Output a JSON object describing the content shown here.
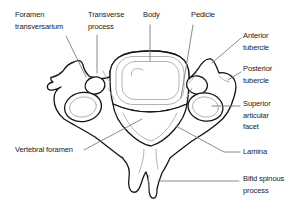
{
  "figure": {
    "illustration": "cervical-vertebra-superior-view",
    "colors": {
      "background": "#ffffff",
      "outline": "#141414",
      "detail": "#9a9a9a",
      "leader": "#7d7d7d",
      "text": "#1a1a1a"
    }
  },
  "labels": [
    {
      "id": "foramen-transversarium",
      "lines": [
        "Foramen",
        "transversarium"
      ]
    },
    {
      "id": "transverse-process",
      "lines": [
        "Transverse",
        "process"
      ]
    },
    {
      "id": "body",
      "lines": [
        "Body"
      ]
    },
    {
      "id": "pedicle",
      "lines": [
        "Pedicle"
      ]
    },
    {
      "id": "anterior-tubercle",
      "lines": [
        "Anterior",
        "tubercle"
      ]
    },
    {
      "id": "posterior-tubercle",
      "lines": [
        "Posterior",
        "tubercle"
      ]
    },
    {
      "id": "superior-articular-facet",
      "lines": [
        "Superior",
        "articular",
        "facet"
      ]
    },
    {
      "id": "lamina",
      "lines": [
        "Lamina"
      ]
    },
    {
      "id": "bifid-spinous-process",
      "lines": [
        "Bifid spinous",
        "process"
      ]
    },
    {
      "id": "vertebral-foramen",
      "lines": [
        "Vertebral foramen"
      ]
    }
  ]
}
